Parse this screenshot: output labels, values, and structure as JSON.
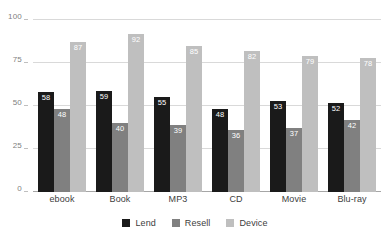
{
  "chart_data": {
    "type": "bar",
    "title": "",
    "subtitle": "",
    "xlabel": "",
    "ylabel": "",
    "ylim": [
      0,
      100
    ],
    "yticks": [
      "0",
      "25",
      "50",
      "75",
      "100"
    ],
    "ytick_values": [
      0,
      25,
      50,
      75,
      100
    ],
    "grid": true,
    "legend_position": "bottom",
    "show_value_labels": true,
    "categories": [
      "ebook",
      "Book",
      "MP3",
      "CD",
      "Movie",
      "Blu-ray"
    ],
    "series": [
      {
        "name": "Lend",
        "color": "#1a1a1a",
        "values": [
          58,
          59,
          55,
          48,
          53,
          52
        ]
      },
      {
        "name": "Resell",
        "color": "#808080",
        "values": [
          48,
          40,
          39,
          36,
          37,
          42
        ]
      },
      {
        "name": "Device",
        "color": "#bfbfbf",
        "values": [
          87,
          92,
          85,
          82,
          79,
          78
        ]
      }
    ]
  },
  "colors": {
    "background": "#ffffff",
    "gridline": "#d9d9d9",
    "axis": "#a6a6a6",
    "tick_text": "#808080",
    "category_text": "#404040",
    "value_text": "#ffffff"
  }
}
